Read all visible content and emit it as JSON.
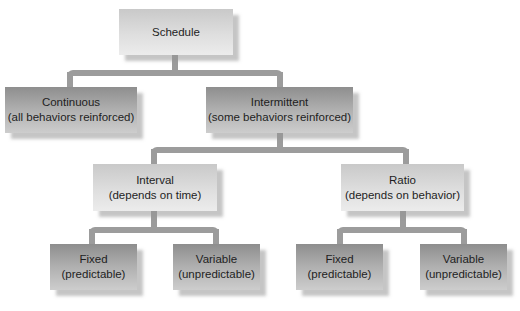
{
  "diagram": {
    "type": "tree",
    "root": {
      "label": "Schedule",
      "children": [
        {
          "label": "Continuous",
          "sublabel": "(all behaviors reinforced)"
        },
        {
          "label": "Intermittent",
          "sublabel": "(some behaviors reinforced)",
          "children": [
            {
              "label": "Interval",
              "sublabel": "(depends on time)",
              "children": [
                {
                  "label": "Fixed",
                  "sublabel": "(predictable)"
                },
                {
                  "label": "Variable",
                  "sublabel": "(unpredictable)"
                }
              ]
            },
            {
              "label": "Ratio",
              "sublabel": "(depends on behavior)",
              "children": [
                {
                  "label": "Fixed",
                  "sublabel": "(predictable)"
                },
                {
                  "label": "Variable",
                  "sublabel": "(unpredictable)"
                }
              ]
            }
          ]
        }
      ]
    }
  },
  "nodes": {
    "schedule": {
      "label": "Schedule"
    },
    "continuous": {
      "label": "Continuous",
      "sublabel": "(all behaviors reinforced)"
    },
    "intermittent": {
      "label": "Intermittent",
      "sublabel": "(some behaviors reinforced)"
    },
    "interval": {
      "label": "Interval",
      "sublabel": "(depends on time)"
    },
    "ratio": {
      "label": "Ratio",
      "sublabel": "(depends on behavior)"
    },
    "interval_fixed": {
      "label": "Fixed",
      "sublabel": "(predictable)"
    },
    "interval_variable": {
      "label": "Variable",
      "sublabel": "(unpredictable)"
    },
    "ratio_fixed": {
      "label": "Fixed",
      "sublabel": "(predictable)"
    },
    "ratio_variable": {
      "label": "Variable",
      "sublabel": "(unpredictable)"
    }
  },
  "colors": {
    "connector": "#9c9c9c",
    "light_box": "#dedede",
    "dark_box": "#b0b0b0",
    "text": "#1e1e1e",
    "background": "#ffffff"
  }
}
